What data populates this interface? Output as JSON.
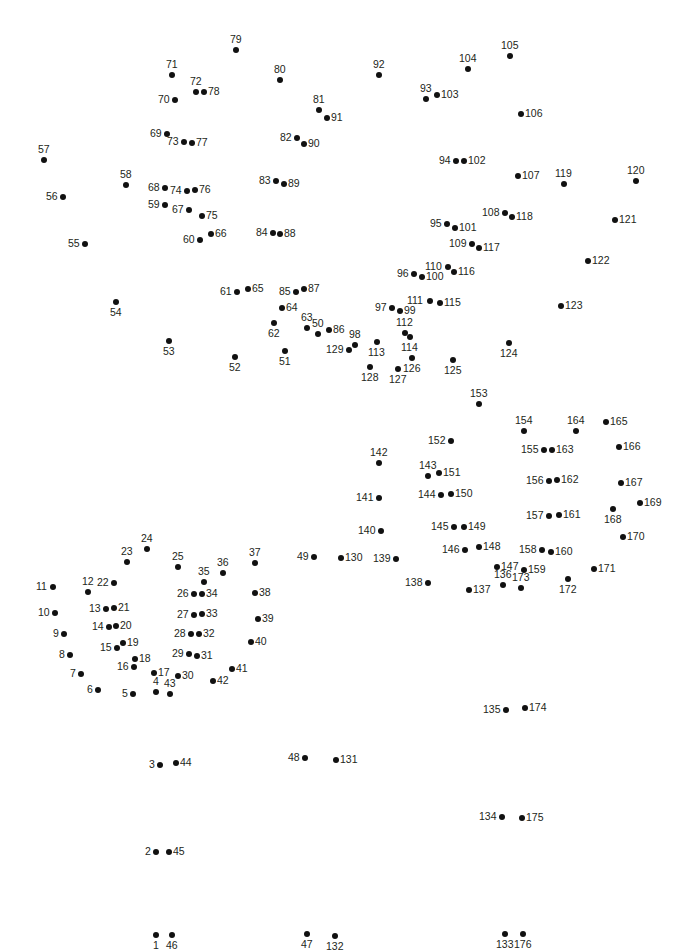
{
  "puzzle": {
    "type": "connect-the-dots",
    "total_points": 176,
    "dot_color": "#111111",
    "label_color": "#231f20",
    "background": "#ffffff",
    "points": [
      {
        "n": 1,
        "x": 156,
        "y": 935,
        "pos": "b"
      },
      {
        "n": 2,
        "x": 156,
        "y": 852,
        "pos": "l"
      },
      {
        "n": 3,
        "x": 160,
        "y": 765,
        "pos": "l"
      },
      {
        "n": 4,
        "x": 156,
        "y": 692,
        "pos": "t"
      },
      {
        "n": 5,
        "x": 133,
        "y": 694,
        "pos": "l"
      },
      {
        "n": 6,
        "x": 98,
        "y": 690,
        "pos": "l"
      },
      {
        "n": 7,
        "x": 81,
        "y": 674,
        "pos": "l"
      },
      {
        "n": 8,
        "x": 70,
        "y": 655,
        "pos": "l"
      },
      {
        "n": 9,
        "x": 64,
        "y": 634,
        "pos": "l"
      },
      {
        "n": 10,
        "x": 55,
        "y": 613,
        "pos": "l"
      },
      {
        "n": 11,
        "x": 53,
        "y": 587,
        "pos": "l"
      },
      {
        "n": 12,
        "x": 88,
        "y": 592,
        "pos": "t"
      },
      {
        "n": 13,
        "x": 106,
        "y": 609,
        "pos": "l"
      },
      {
        "n": 14,
        "x": 109,
        "y": 627,
        "pos": "l"
      },
      {
        "n": 15,
        "x": 117,
        "y": 648,
        "pos": "l"
      },
      {
        "n": 16,
        "x": 134,
        "y": 667,
        "pos": "l"
      },
      {
        "n": 17,
        "x": 154,
        "y": 673,
        "pos": "r"
      },
      {
        "n": 18,
        "x": 135,
        "y": 659,
        "pos": "r"
      },
      {
        "n": 19,
        "x": 123,
        "y": 643,
        "pos": "r"
      },
      {
        "n": 20,
        "x": 116,
        "y": 626,
        "pos": "r"
      },
      {
        "n": 21,
        "x": 114,
        "y": 608,
        "pos": "r"
      },
      {
        "n": 22,
        "x": 114,
        "y": 583,
        "pos": "l"
      },
      {
        "n": 23,
        "x": 127,
        "y": 562,
        "pos": "t"
      },
      {
        "n": 24,
        "x": 147,
        "y": 549,
        "pos": "t"
      },
      {
        "n": 25,
        "x": 178,
        "y": 567,
        "pos": "t"
      },
      {
        "n": 26,
        "x": 194,
        "y": 594,
        "pos": "l"
      },
      {
        "n": 27,
        "x": 194,
        "y": 615,
        "pos": "l"
      },
      {
        "n": 28,
        "x": 191,
        "y": 634,
        "pos": "l"
      },
      {
        "n": 29,
        "x": 189,
        "y": 654,
        "pos": "l"
      },
      {
        "n": 30,
        "x": 178,
        "y": 676,
        "pos": "r"
      },
      {
        "n": 31,
        "x": 197,
        "y": 656,
        "pos": "r"
      },
      {
        "n": 32,
        "x": 199,
        "y": 634,
        "pos": "r"
      },
      {
        "n": 33,
        "x": 202,
        "y": 614,
        "pos": "r"
      },
      {
        "n": 34,
        "x": 202,
        "y": 594,
        "pos": "r"
      },
      {
        "n": 35,
        "x": 204,
        "y": 582,
        "pos": "t"
      },
      {
        "n": 36,
        "x": 223,
        "y": 573,
        "pos": "t"
      },
      {
        "n": 37,
        "x": 255,
        "y": 563,
        "pos": "t"
      },
      {
        "n": 38,
        "x": 255,
        "y": 593,
        "pos": "r"
      },
      {
        "n": 39,
        "x": 258,
        "y": 619,
        "pos": "r"
      },
      {
        "n": 40,
        "x": 251,
        "y": 642,
        "pos": "r"
      },
      {
        "n": 41,
        "x": 232,
        "y": 669,
        "pos": "r"
      },
      {
        "n": 42,
        "x": 213,
        "y": 681,
        "pos": "r"
      },
      {
        "n": 43,
        "x": 170,
        "y": 694,
        "pos": "t"
      },
      {
        "n": 44,
        "x": 176,
        "y": 763,
        "pos": "r"
      },
      {
        "n": 45,
        "x": 169,
        "y": 852,
        "pos": "r"
      },
      {
        "n": 46,
        "x": 172,
        "y": 935,
        "pos": "b"
      },
      {
        "n": 47,
        "x": 307,
        "y": 934,
        "pos": "b"
      },
      {
        "n": 48,
        "x": 305,
        "y": 758,
        "pos": "l"
      },
      {
        "n": 49,
        "x": 314,
        "y": 557,
        "pos": "l"
      },
      {
        "n": 50,
        "x": 318,
        "y": 334,
        "pos": "t"
      },
      {
        "n": 51,
        "x": 285,
        "y": 351,
        "pos": "b"
      },
      {
        "n": 52,
        "x": 235,
        "y": 357,
        "pos": "b"
      },
      {
        "n": 53,
        "x": 169,
        "y": 341,
        "pos": "b"
      },
      {
        "n": 54,
        "x": 116,
        "y": 302,
        "pos": "b"
      },
      {
        "n": 55,
        "x": 85,
        "y": 244,
        "pos": "l"
      },
      {
        "n": 56,
        "x": 63,
        "y": 197,
        "pos": "l"
      },
      {
        "n": 57,
        "x": 44,
        "y": 160,
        "pos": "t"
      },
      {
        "n": 58,
        "x": 126,
        "y": 185,
        "pos": "t"
      },
      {
        "n": 59,
        "x": 165,
        "y": 205,
        "pos": "l"
      },
      {
        "n": 60,
        "x": 200,
        "y": 240,
        "pos": "l"
      },
      {
        "n": 61,
        "x": 237,
        "y": 292,
        "pos": "l"
      },
      {
        "n": 62,
        "x": 274,
        "y": 323,
        "pos": "b"
      },
      {
        "n": 63,
        "x": 307,
        "y": 328,
        "pos": "t"
      },
      {
        "n": 64,
        "x": 282,
        "y": 308,
        "pos": "r"
      },
      {
        "n": 65,
        "x": 248,
        "y": 289,
        "pos": "r"
      },
      {
        "n": 66,
        "x": 211,
        "y": 234,
        "pos": "r"
      },
      {
        "n": 67,
        "x": 189,
        "y": 210,
        "pos": "l"
      },
      {
        "n": 68,
        "x": 165,
        "y": 188,
        "pos": "l"
      },
      {
        "n": 69,
        "x": 167,
        "y": 134,
        "pos": "l"
      },
      {
        "n": 70,
        "x": 175,
        "y": 100,
        "pos": "l"
      },
      {
        "n": 71,
        "x": 172,
        "y": 75,
        "pos": "t"
      },
      {
        "n": 72,
        "x": 196,
        "y": 92,
        "pos": "t"
      },
      {
        "n": 73,
        "x": 184,
        "y": 142,
        "pos": "l"
      },
      {
        "n": 74,
        "x": 187,
        "y": 191,
        "pos": "l"
      },
      {
        "n": 75,
        "x": 202,
        "y": 216,
        "pos": "r"
      },
      {
        "n": 76,
        "x": 195,
        "y": 190,
        "pos": "r"
      },
      {
        "n": 77,
        "x": 192,
        "y": 143,
        "pos": "r"
      },
      {
        "n": 78,
        "x": 204,
        "y": 92,
        "pos": "r"
      },
      {
        "n": 79,
        "x": 236,
        "y": 50,
        "pos": "t"
      },
      {
        "n": 80,
        "x": 280,
        "y": 80,
        "pos": "t"
      },
      {
        "n": 81,
        "x": 319,
        "y": 110,
        "pos": "t"
      },
      {
        "n": 82,
        "x": 297,
        "y": 138,
        "pos": "l"
      },
      {
        "n": 83,
        "x": 276,
        "y": 181,
        "pos": "l"
      },
      {
        "n": 84,
        "x": 273,
        "y": 233,
        "pos": "l"
      },
      {
        "n": 85,
        "x": 296,
        "y": 292,
        "pos": "l"
      },
      {
        "n": 86,
        "x": 329,
        "y": 330,
        "pos": "r"
      },
      {
        "n": 87,
        "x": 304,
        "y": 289,
        "pos": "r"
      },
      {
        "n": 88,
        "x": 280,
        "y": 234,
        "pos": "r"
      },
      {
        "n": 89,
        "x": 284,
        "y": 184,
        "pos": "r"
      },
      {
        "n": 90,
        "x": 304,
        "y": 144,
        "pos": "r"
      },
      {
        "n": 91,
        "x": 327,
        "y": 118,
        "pos": "r"
      },
      {
        "n": 92,
        "x": 379,
        "y": 75,
        "pos": "t"
      },
      {
        "n": 93,
        "x": 426,
        "y": 99,
        "pos": "t"
      },
      {
        "n": 94,
        "x": 456,
        "y": 161,
        "pos": "l"
      },
      {
        "n": 95,
        "x": 447,
        "y": 224,
        "pos": "l"
      },
      {
        "n": 96,
        "x": 414,
        "y": 274,
        "pos": "l"
      },
      {
        "n": 97,
        "x": 392,
        "y": 308,
        "pos": "l"
      },
      {
        "n": 98,
        "x": 355,
        "y": 345,
        "pos": "t"
      },
      {
        "n": 99,
        "x": 400,
        "y": 311,
        "pos": "r"
      },
      {
        "n": 100,
        "x": 422,
        "y": 277,
        "pos": "r"
      },
      {
        "n": 101,
        "x": 455,
        "y": 228,
        "pos": "r"
      },
      {
        "n": 102,
        "x": 464,
        "y": 161,
        "pos": "r"
      },
      {
        "n": 103,
        "x": 437,
        "y": 95,
        "pos": "r"
      },
      {
        "n": 104,
        "x": 468,
        "y": 69,
        "pos": "t"
      },
      {
        "n": 105,
        "x": 510,
        "y": 56,
        "pos": "t"
      },
      {
        "n": 106,
        "x": 521,
        "y": 114,
        "pos": "r"
      },
      {
        "n": 107,
        "x": 518,
        "y": 176,
        "pos": "r"
      },
      {
        "n": 108,
        "x": 505,
        "y": 213,
        "pos": "l"
      },
      {
        "n": 109,
        "x": 472,
        "y": 244,
        "pos": "l"
      },
      {
        "n": 110,
        "x": 448,
        "y": 267,
        "pos": "l"
      },
      {
        "n": 111,
        "x": 430,
        "y": 301,
        "pos": "l"
      },
      {
        "n": 112,
        "x": 405,
        "y": 333,
        "pos": "t"
      },
      {
        "n": 113,
        "x": 377,
        "y": 342,
        "pos": "b"
      },
      {
        "n": 114,
        "x": 410,
        "y": 337,
        "pos": "b"
      },
      {
        "n": 115,
        "x": 440,
        "y": 303,
        "pos": "r"
      },
      {
        "n": 116,
        "x": 454,
        "y": 272,
        "pos": "r"
      },
      {
        "n": 117,
        "x": 479,
        "y": 248,
        "pos": "r"
      },
      {
        "n": 118,
        "x": 512,
        "y": 217,
        "pos": "r"
      },
      {
        "n": 119,
        "x": 564,
        "y": 184,
        "pos": "t"
      },
      {
        "n": 120,
        "x": 636,
        "y": 181,
        "pos": "t"
      },
      {
        "n": 121,
        "x": 615,
        "y": 220,
        "pos": "r"
      },
      {
        "n": 122,
        "x": 588,
        "y": 261,
        "pos": "r"
      },
      {
        "n": 123,
        "x": 561,
        "y": 306,
        "pos": "r"
      },
      {
        "n": 124,
        "x": 509,
        "y": 343,
        "pos": "b"
      },
      {
        "n": 125,
        "x": 453,
        "y": 360,
        "pos": "b"
      },
      {
        "n": 126,
        "x": 412,
        "y": 358,
        "pos": "b"
      },
      {
        "n": 127,
        "x": 398,
        "y": 369,
        "pos": "b"
      },
      {
        "n": 128,
        "x": 370,
        "y": 367,
        "pos": "b"
      },
      {
        "n": 129,
        "x": 349,
        "y": 350,
        "pos": "l"
      },
      {
        "n": 130,
        "x": 341,
        "y": 558,
        "pos": "r"
      },
      {
        "n": 131,
        "x": 336,
        "y": 760,
        "pos": "r"
      },
      {
        "n": 132,
        "x": 335,
        "y": 936,
        "pos": "b"
      },
      {
        "n": 133,
        "x": 505,
        "y": 934,
        "pos": "b"
      },
      {
        "n": 134,
        "x": 502,
        "y": 817,
        "pos": "l"
      },
      {
        "n": 135,
        "x": 506,
        "y": 710,
        "pos": "l"
      },
      {
        "n": 136,
        "x": 503,
        "y": 585,
        "pos": "t"
      },
      {
        "n": 137,
        "x": 469,
        "y": 590,
        "pos": "r"
      },
      {
        "n": 138,
        "x": 428,
        "y": 583,
        "pos": "l"
      },
      {
        "n": 139,
        "x": 396,
        "y": 559,
        "pos": "l"
      },
      {
        "n": 140,
        "x": 381,
        "y": 531,
        "pos": "l"
      },
      {
        "n": 141,
        "x": 379,
        "y": 498,
        "pos": "l"
      },
      {
        "n": 142,
        "x": 379,
        "y": 463,
        "pos": "t"
      },
      {
        "n": 143,
        "x": 428,
        "y": 476,
        "pos": "t"
      },
      {
        "n": 144,
        "x": 441,
        "y": 495,
        "pos": "l"
      },
      {
        "n": 145,
        "x": 454,
        "y": 527,
        "pos": "l"
      },
      {
        "n": 146,
        "x": 465,
        "y": 550,
        "pos": "l"
      },
      {
        "n": 147,
        "x": 497,
        "y": 567,
        "pos": "r"
      },
      {
        "n": 148,
        "x": 479,
        "y": 547,
        "pos": "r"
      },
      {
        "n": 149,
        "x": 464,
        "y": 527,
        "pos": "r"
      },
      {
        "n": 150,
        "x": 451,
        "y": 494,
        "pos": "r"
      },
      {
        "n": 151,
        "x": 439,
        "y": 473,
        "pos": "r"
      },
      {
        "n": 152,
        "x": 451,
        "y": 441,
        "pos": "l"
      },
      {
        "n": 153,
        "x": 479,
        "y": 404,
        "pos": "t"
      },
      {
        "n": 154,
        "x": 524,
        "y": 431,
        "pos": "t"
      },
      {
        "n": 155,
        "x": 544,
        "y": 450,
        "pos": "l"
      },
      {
        "n": 156,
        "x": 549,
        "y": 481,
        "pos": "l"
      },
      {
        "n": 157,
        "x": 549,
        "y": 516,
        "pos": "l"
      },
      {
        "n": 158,
        "x": 542,
        "y": 550,
        "pos": "l"
      },
      {
        "n": 159,
        "x": 524,
        "y": 570,
        "pos": "r"
      },
      {
        "n": 160,
        "x": 551,
        "y": 552,
        "pos": "r"
      },
      {
        "n": 161,
        "x": 559,
        "y": 515,
        "pos": "r"
      },
      {
        "n": 162,
        "x": 557,
        "y": 480,
        "pos": "r"
      },
      {
        "n": 163,
        "x": 552,
        "y": 450,
        "pos": "r"
      },
      {
        "n": 164,
        "x": 576,
        "y": 431,
        "pos": "t"
      },
      {
        "n": 165,
        "x": 606,
        "y": 422,
        "pos": "r"
      },
      {
        "n": 166,
        "x": 619,
        "y": 447,
        "pos": "r"
      },
      {
        "n": 167,
        "x": 621,
        "y": 483,
        "pos": "r"
      },
      {
        "n": 168,
        "x": 613,
        "y": 509,
        "pos": "b"
      },
      {
        "n": 169,
        "x": 640,
        "y": 503,
        "pos": "r"
      },
      {
        "n": 170,
        "x": 623,
        "y": 537,
        "pos": "r"
      },
      {
        "n": 171,
        "x": 594,
        "y": 569,
        "pos": "r"
      },
      {
        "n": 172,
        "x": 568,
        "y": 579,
        "pos": "b"
      },
      {
        "n": 173,
        "x": 521,
        "y": 588,
        "pos": "t"
      },
      {
        "n": 174,
        "x": 525,
        "y": 708,
        "pos": "r"
      },
      {
        "n": 175,
        "x": 522,
        "y": 818,
        "pos": "r"
      },
      {
        "n": 176,
        "x": 523,
        "y": 934,
        "pos": "b"
      }
    ]
  }
}
